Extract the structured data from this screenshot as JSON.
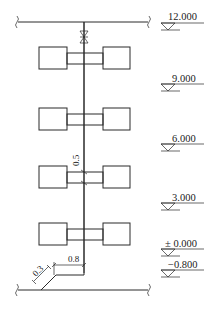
{
  "diagram": {
    "type": "pipe riser elevation (system diagram)",
    "elevations": [
      {
        "label": "12.000",
        "y": 22
      },
      {
        "label": "9.000",
        "y": 85
      },
      {
        "label": "6.000",
        "y": 143
      },
      {
        "label": "3.000",
        "y": 202
      },
      {
        "label": "± 0.000",
        "y": 248
      },
      {
        "label": "−0.800",
        "y": 268
      }
    ],
    "dimensions": {
      "vertical_offset": "0.5",
      "horizontal_offset": "0.8",
      "diagonal_offset": "0.3"
    },
    "fixtures": [
      {
        "floor": 4,
        "y": 47
      },
      {
        "floor": 3,
        "y": 108
      },
      {
        "floor": 2,
        "y": 166
      },
      {
        "floor": 1,
        "y": 223
      }
    ],
    "valve": "gate-valve-icon at top riser"
  }
}
